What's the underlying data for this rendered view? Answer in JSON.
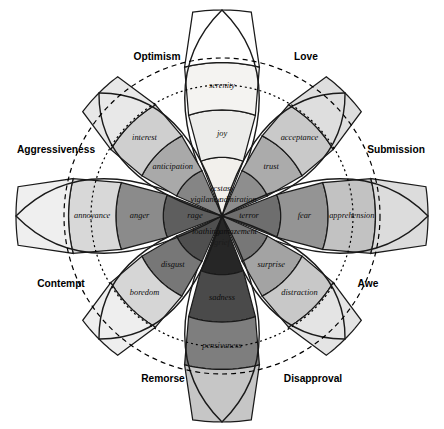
{
  "diagram": {
    "type": "radial-emotion-wheel",
    "center": {
      "x": 222,
      "y": 216
    },
    "background_color": "#ffffff",
    "outline_color": "#1a1a1a",
    "guide_circles": [
      {
        "name": "outer-dashed-circle",
        "radius": 158,
        "style": "dashed"
      },
      {
        "name": "inner-dotted-circle",
        "radius": 131,
        "style": "dotted"
      }
    ],
    "petals": [
      {
        "name": "joy-petal",
        "angle_deg": -90,
        "length": 206,
        "primary": "joy",
        "levels": [
          {
            "label": "ecstasy",
            "intensity": "high",
            "color": "#f2f0ec"
          },
          {
            "label": "joy",
            "intensity": "medium",
            "color": "#ececea"
          },
          {
            "label": "serenity",
            "intensity": "low",
            "color": "#f4f3f1"
          },
          {
            "label": "",
            "intensity": "tip",
            "color": "#ffffff"
          }
        ]
      },
      {
        "name": "trust-petal",
        "angle_deg": -45,
        "length": 174,
        "primary": "trust",
        "levels": [
          {
            "label": "admiration",
            "intensity": "high",
            "color": "#8e8e8e"
          },
          {
            "label": "trust",
            "intensity": "medium",
            "color": "#ababab"
          },
          {
            "label": "acceptance",
            "intensity": "low",
            "color": "#c9c9c9"
          },
          {
            "label": "",
            "intensity": "tip",
            "color": "#dedede"
          }
        ]
      },
      {
        "name": "fear-petal",
        "angle_deg": 0,
        "length": 206,
        "primary": "fear",
        "levels": [
          {
            "label": "terror",
            "intensity": "high",
            "color": "#6e6e6e"
          },
          {
            "label": "fear",
            "intensity": "medium",
            "color": "#949494"
          },
          {
            "label": "apprehension",
            "intensity": "low",
            "color": "#c2c2c2"
          },
          {
            "label": "",
            "intensity": "tip",
            "color": "#dcdcdc"
          }
        ]
      },
      {
        "name": "surprise-petal",
        "angle_deg": 45,
        "length": 174,
        "primary": "surprise",
        "levels": [
          {
            "label": "amazement",
            "intensity": "high",
            "color": "#777777"
          },
          {
            "label": "surprise",
            "intensity": "medium",
            "color": "#a3a3a3"
          },
          {
            "label": "distraction",
            "intensity": "low",
            "color": "#c8c8c8"
          },
          {
            "label": "",
            "intensity": "tip",
            "color": "#e4e4e4"
          }
        ]
      },
      {
        "name": "sadness-petal",
        "angle_deg": 90,
        "length": 206,
        "primary": "sadness",
        "levels": [
          {
            "label": "grief",
            "intensity": "high",
            "color": "#262626"
          },
          {
            "label": "sadness",
            "intensity": "medium",
            "color": "#4a4a4a"
          },
          {
            "label": "pensiveness",
            "intensity": "low",
            "color": "#7e7e7e"
          },
          {
            "label": "",
            "intensity": "tip",
            "color": "#c6c6c6"
          }
        ]
      },
      {
        "name": "disgust-petal",
        "angle_deg": 135,
        "length": 174,
        "primary": "disgust",
        "levels": [
          {
            "label": "loathing",
            "intensity": "high",
            "color": "#4f4f4f"
          },
          {
            "label": "disgust",
            "intensity": "medium",
            "color": "#777777"
          },
          {
            "label": "boredom",
            "intensity": "low",
            "color": "#d6d6d6"
          },
          {
            "label": "",
            "intensity": "tip",
            "color": "#eeeeee"
          }
        ]
      },
      {
        "name": "anger-petal",
        "angle_deg": 180,
        "length": 206,
        "primary": "anger",
        "levels": [
          {
            "label": "rage",
            "intensity": "high",
            "color": "#5e5e5e"
          },
          {
            "label": "anger",
            "intensity": "medium",
            "color": "#8b8b8b"
          },
          {
            "label": "annoyance",
            "intensity": "low",
            "color": "#d8d8d8"
          },
          {
            "label": "",
            "intensity": "tip",
            "color": "#efefef"
          }
        ]
      },
      {
        "name": "anticipation-petal",
        "angle_deg": -135,
        "length": 174,
        "primary": "anticipation",
        "levels": [
          {
            "label": "vigilance",
            "intensity": "high",
            "color": "#858585"
          },
          {
            "label": "anticipation",
            "intensity": "medium",
            "color": "#a9a9a9"
          },
          {
            "label": "interest",
            "intensity": "low",
            "color": "#cfcfcf"
          },
          {
            "label": "",
            "intensity": "tip",
            "color": "#e8e8e8"
          }
        ]
      }
    ],
    "dyads": [
      {
        "name": "optimism-dyad",
        "label": "Optimism",
        "x": 157,
        "y": 57
      },
      {
        "name": "love-dyad",
        "label": "Love",
        "x": 306,
        "y": 57
      },
      {
        "name": "submission-dyad",
        "label": "Submission",
        "x": 396,
        "y": 150
      },
      {
        "name": "awe-dyad",
        "label": "Awe",
        "x": 368,
        "y": 284
      },
      {
        "name": "disapproval-dyad",
        "label": "Disapproval",
        "x": 313,
        "y": 379
      },
      {
        "name": "remorse-dyad",
        "label": "Remorse",
        "x": 163,
        "y": 379
      },
      {
        "name": "contempt-dyad",
        "label": "Contempt",
        "x": 61,
        "y": 284
      },
      {
        "name": "aggressiveness-dyad",
        "label": "Aggressiveness",
        "x": 56,
        "y": 150
      }
    ]
  }
}
